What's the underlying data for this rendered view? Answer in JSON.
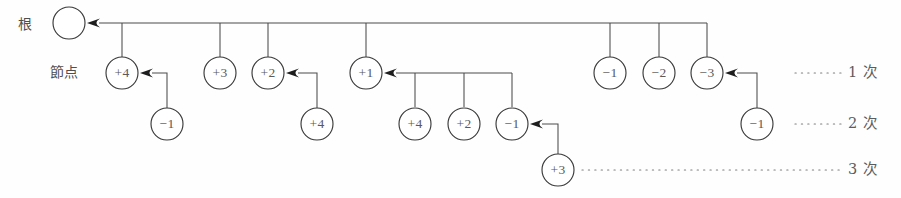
{
  "diagram": {
    "labels": {
      "root": "根",
      "node": "節点"
    },
    "tiers": [
      {
        "id": "tier-1",
        "label": "1 次",
        "y": 73
      },
      {
        "id": "tier-2",
        "label": "2 次",
        "y": 124
      },
      {
        "id": "tier-3",
        "label": "3 次",
        "y": 170
      }
    ],
    "colors": {
      "stroke": "#3a3a3a",
      "text": "#5a5a5a",
      "background": "#fefefe",
      "arrow": "#1d1d1d",
      "dots": "#7d7d7d"
    },
    "root_node": {
      "id": "root",
      "label": "",
      "cx": 69,
      "cy": 23,
      "r": 16
    },
    "nodes": [
      {
        "id": "n-t1-a",
        "label": "+4",
        "cx": 122,
        "cy": 73,
        "r": 16,
        "tier": 1
      },
      {
        "id": "n-t1-b",
        "label": "+3",
        "cx": 220,
        "cy": 73,
        "r": 16,
        "tier": 1
      },
      {
        "id": "n-t1-c",
        "label": "+2",
        "cx": 268,
        "cy": 73,
        "r": 16,
        "tier": 1
      },
      {
        "id": "n-t1-d",
        "label": "+1",
        "cx": 366,
        "cy": 73,
        "r": 16,
        "tier": 1
      },
      {
        "id": "n-t1-e",
        "label": "-1",
        "cx": 610,
        "cy": 73,
        "r": 16,
        "tier": 1
      },
      {
        "id": "n-t1-f",
        "label": "-2",
        "cx": 659,
        "cy": 73,
        "r": 16,
        "tier": 1
      },
      {
        "id": "n-t1-g",
        "label": "-3",
        "cx": 707,
        "cy": 73,
        "r": 16,
        "tier": 1
      },
      {
        "id": "n-t2-a",
        "label": "-1",
        "cx": 167,
        "cy": 124,
        "r": 16,
        "tier": 2
      },
      {
        "id": "n-t2-b",
        "label": "+4",
        "cx": 317,
        "cy": 124,
        "r": 16,
        "tier": 2
      },
      {
        "id": "n-t2-c",
        "label": "+4",
        "cx": 415,
        "cy": 124,
        "r": 16,
        "tier": 2
      },
      {
        "id": "n-t2-d",
        "label": "+2",
        "cx": 464,
        "cy": 124,
        "r": 16,
        "tier": 2
      },
      {
        "id": "n-t2-e",
        "label": "-1",
        "cx": 512,
        "cy": 124,
        "r": 16,
        "tier": 2
      },
      {
        "id": "n-t2-f",
        "label": "-1",
        "cx": 757,
        "cy": 124,
        "r": 16,
        "tier": 2
      },
      {
        "id": "n-t3-a",
        "label": "+3",
        "cx": 558,
        "cy": 170,
        "r": 16,
        "tier": 3
      }
    ],
    "bus_edges": [
      {
        "id": "bus-root",
        "parent": "root",
        "arrow_to": {
          "x": 87,
          "y": 23
        },
        "bus_y": 23,
        "bus_x1": 100,
        "bus_x2": 707,
        "drops": [
          122,
          220,
          268,
          366,
          610,
          659,
          707
        ]
      },
      {
        "id": "bus-n-t1-d",
        "parent": "n-t1-d",
        "arrow_to": {
          "x": 384,
          "y": 73
        },
        "bus_y": 73,
        "bus_x1": 397,
        "bus_x2": 512,
        "drops": [
          415,
          464,
          512
        ]
      }
    ],
    "elbow_edges": [
      {
        "id": "elbow-a",
        "child": "n-t2-a",
        "from": {
          "x": 167,
          "y": 108
        },
        "corner": {
          "x": 167,
          "y": 73
        },
        "arrow_to": {
          "x": 140,
          "y": 73
        }
      },
      {
        "id": "elbow-b",
        "child": "n-t2-b",
        "from": {
          "x": 317,
          "y": 108
        },
        "corner": {
          "x": 317,
          "y": 73
        },
        "arrow_to": {
          "x": 286,
          "y": 73
        }
      },
      {
        "id": "elbow-c",
        "child": "n-t3-a",
        "from": {
          "x": 558,
          "y": 154
        },
        "corner": {
          "x": 558,
          "y": 124
        },
        "arrow_to": {
          "x": 530,
          "y": 124
        }
      },
      {
        "id": "elbow-d",
        "child": "n-t2-f",
        "from": {
          "x": 757,
          "y": 108
        },
        "corner": {
          "x": 757,
          "y": 73
        },
        "arrow_to": {
          "x": 725,
          "y": 73
        }
      }
    ],
    "leaders": [
      {
        "id": "leader-tier-1",
        "x1": 795,
        "x2": 842,
        "y": 73,
        "label": "1 次",
        "label_x": 848
      },
      {
        "id": "leader-tier-2",
        "x1": 795,
        "x2": 842,
        "y": 124,
        "label": "2 次",
        "label_x": 848
      },
      {
        "id": "leader-tier-3",
        "x1": 582,
        "x2": 842,
        "y": 170,
        "label": "3 次",
        "label_x": 848
      }
    ],
    "side_labels": [
      {
        "id": "label-root",
        "text": "根",
        "x": 18,
        "y": 25
      },
      {
        "id": "label-node",
        "text": "節点",
        "x": 50,
        "y": 73
      }
    ]
  }
}
